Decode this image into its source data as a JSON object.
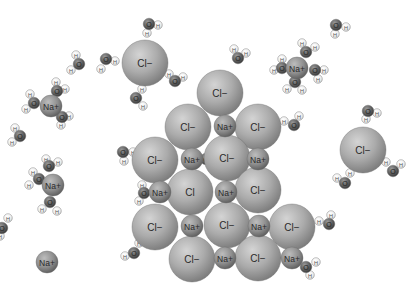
{
  "diagram": {
    "colors": {
      "background": "#ffffff",
      "chloride": "#a9a9a9",
      "sodium": "#8f8f8f",
      "oxygen": "#6a6a6a",
      "hydrogen": "#eeeeee"
    },
    "labels": {
      "chloride": "Cl−",
      "sodium": "Na+",
      "oxygen": "O",
      "hydrogen": "H"
    },
    "crystal": {
      "chloride_ions": [
        {
          "x": 220,
          "y": 93,
          "label": "Cl−"
        },
        {
          "x": 188,
          "y": 127,
          "label": "Cl−"
        },
        {
          "x": 258,
          "y": 127,
          "label": "Cl−"
        },
        {
          "x": 155,
          "y": 160,
          "label": "Cl−"
        },
        {
          "x": 227,
          "y": 158,
          "label": "Cl−"
        },
        {
          "x": 190,
          "y": 192,
          "label": "Cl"
        },
        {
          "x": 258,
          "y": 190,
          "label": "Cl−"
        },
        {
          "x": 155,
          "y": 227,
          "label": "Cl−"
        },
        {
          "x": 227,
          "y": 225,
          "label": "Cl−"
        },
        {
          "x": 292,
          "y": 227,
          "label": "Cl−"
        },
        {
          "x": 192,
          "y": 259,
          "label": "Cl−"
        },
        {
          "x": 258,
          "y": 258,
          "label": "Cl−"
        }
      ],
      "sodium_ions": [
        {
          "x": 225,
          "y": 126,
          "label": "Na+"
        },
        {
          "x": 192,
          "y": 159,
          "label": "Na+"
        },
        {
          "x": 258,
          "y": 159,
          "label": "Na+"
        },
        {
          "x": 160,
          "y": 192,
          "label": "Na+"
        },
        {
          "x": 226,
          "y": 192,
          "label": "Na+"
        },
        {
          "x": 192,
          "y": 226,
          "label": "Na+"
        },
        {
          "x": 259,
          "y": 226,
          "label": "Na+"
        },
        {
          "x": 225,
          "y": 258,
          "label": "Na+"
        },
        {
          "x": 292,
          "y": 258,
          "label": "Na+"
        }
      ]
    },
    "free_ions": [
      {
        "type": "chloride",
        "x": 145,
        "y": 63,
        "label": "Cl−"
      },
      {
        "type": "chloride",
        "x": 363,
        "y": 150,
        "label": "Cl−"
      },
      {
        "type": "sodium",
        "x": 51,
        "y": 106,
        "label": "Na+"
      },
      {
        "type": "sodium",
        "x": 297,
        "y": 68,
        "label": "Na+"
      },
      {
        "type": "sodium",
        "x": 53,
        "y": 185,
        "label": "Na+"
      },
      {
        "type": "sodium",
        "x": 47,
        "y": 262,
        "label": "Na+"
      }
    ],
    "water_molecules": [
      {
        "o": [
          149,
          24
        ],
        "h": [
          [
            158,
            25
          ],
          [
            147,
            33
          ]
        ]
      },
      {
        "o": [
          106,
          59
        ],
        "h": [
          [
            115,
            61
          ],
          [
            101,
            69
          ]
        ]
      },
      {
        "o": [
          79,
          64
        ],
        "h": [
          [
            76,
            55
          ],
          [
            71,
            70
          ]
        ]
      },
      {
        "o": [
          175,
          81
        ],
        "h": [
          [
            169,
            74
          ],
          [
            183,
            77
          ]
        ]
      },
      {
        "o": [
          136,
          98
        ],
        "h": [
          [
            142,
            89
          ],
          [
            143,
            106
          ]
        ]
      },
      {
        "o": [
          57,
          91
        ],
        "h": [
          [
            56,
            82
          ],
          [
            65,
            89
          ]
        ]
      },
      {
        "o": [
          34,
          103
        ],
        "h": [
          [
            30,
            94
          ],
          [
            26,
            109
          ]
        ]
      },
      {
        "o": [
          62,
          117
        ],
        "h": [
          [
            69,
            116
          ],
          [
            61,
            125
          ]
        ]
      },
      {
        "o": [
          20,
          136
        ],
        "h": [
          [
            15,
            128
          ],
          [
            12,
            142
          ]
        ]
      },
      {
        "o": [
          238,
          58
        ],
        "h": [
          [
            234,
            49
          ],
          [
            246,
            53
          ]
        ]
      },
      {
        "o": [
          336,
          25
        ],
        "h": [
          [
            346,
            27
          ],
          [
            335,
            34
          ]
        ]
      },
      {
        "o": [
          306,
          52
        ],
        "h": [
          [
            302,
            43
          ],
          [
            315,
            47
          ]
        ]
      },
      {
        "o": [
          282,
          68
        ],
        "h": [
          [
            282,
            59
          ],
          [
            274,
            70
          ]
        ]
      },
      {
        "o": [
          315,
          70
        ],
        "h": [
          [
            324,
            70
          ],
          [
            318,
            79
          ]
        ]
      },
      {
        "o": [
          295,
          82
        ],
        "h": [
          [
            287,
            89
          ],
          [
            302,
            90
          ]
        ]
      },
      {
        "o": [
          294,
          125
        ],
        "h": [
          [
            284,
            121
          ],
          [
            299,
            116
          ]
        ]
      },
      {
        "o": [
          368,
          111
        ],
        "h": [
          [
            377,
            113
          ],
          [
            366,
            119
          ]
        ]
      },
      {
        "o": [
          123,
          152
        ],
        "h": [
          [
            133,
            152
          ],
          [
            124,
            161
          ]
        ]
      },
      {
        "o": [
          345,
          183
        ],
        "h": [
          [
            337,
            178
          ],
          [
            350,
            173
          ]
        ]
      },
      {
        "o": [
          393,
          171
        ],
        "h": [
          [
            386,
            162
          ],
          [
            401,
            164
          ]
        ]
      },
      {
        "o": [
          49,
          166
        ],
        "h": [
          [
            46,
            159
          ],
          [
            58,
            162
          ]
        ]
      },
      {
        "o": [
          39,
          179
        ],
        "h": [
          [
            33,
            172
          ],
          [
            29,
            185
          ]
        ]
      },
      {
        "o": [
          50,
          202
        ],
        "h": [
          [
            42,
            209
          ],
          [
            57,
            211
          ]
        ]
      },
      {
        "o": [
          144,
          193
        ],
        "h": [
          [
            142,
            185
          ],
          [
            139,
            201
          ]
        ]
      },
      {
        "o": [
          206,
          159
        ],
        "h": [
          [
            211,
            150
          ],
          [
            213,
            165
          ]
        ]
      },
      {
        "o": [
          134,
          253
        ],
        "h": [
          [
            139,
            243
          ],
          [
            125,
            256
          ]
        ]
      },
      {
        "o": [
          329,
          224
        ],
        "h": [
          [
            319,
            221
          ],
          [
            331,
            215
          ]
        ]
      },
      {
        "o": [
          306,
          267
        ],
        "h": [
          [
            316,
            262
          ],
          [
            310,
            275
          ]
        ]
      },
      {
        "o": [
          2,
          228
        ],
        "h": [
          [
            8,
            218
          ],
          [
            0,
            236
          ]
        ]
      }
    ]
  }
}
